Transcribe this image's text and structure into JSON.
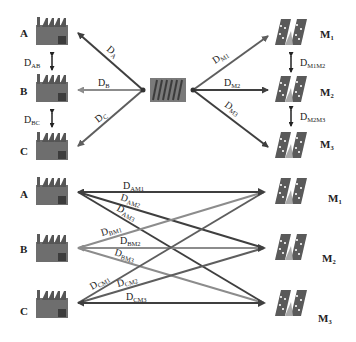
{
  "colors": {
    "dark_line": "#3f3f3f",
    "mid_line": "#5e5e5e",
    "light_line": "#8c8c8c",
    "factory_body": "#6e6e6e",
    "factory_door": "#3c3c3c",
    "market_fill": "#5a5a5a"
  },
  "top": {
    "factories": [
      {
        "id": "A",
        "label": "A"
      },
      {
        "id": "B",
        "label": "B"
      },
      {
        "id": "C",
        "label": "C"
      }
    ],
    "factory_distances": [
      {
        "main": "D",
        "sub": "AB"
      },
      {
        "main": "D",
        "sub": "BC"
      }
    ],
    "hub_to_factories": [
      {
        "main": "D",
        "sub": "A"
      },
      {
        "main": "D",
        "sub": "B"
      },
      {
        "main": "D",
        "sub": "C"
      }
    ],
    "hub_to_markets": [
      {
        "main": "D",
        "sub": "M1"
      },
      {
        "main": "D",
        "sub": "M2"
      },
      {
        "main": "D",
        "sub": "M3"
      }
    ],
    "markets": [
      {
        "main": "M",
        "sub": "1"
      },
      {
        "main": "M",
        "sub": "2"
      },
      {
        "main": "M",
        "sub": "3"
      }
    ],
    "market_distances": [
      {
        "main": "D",
        "sub": "M1M2"
      },
      {
        "main": "D",
        "sub": "M2M3"
      }
    ]
  },
  "bottom": {
    "factories": [
      {
        "id": "A",
        "label": "A"
      },
      {
        "id": "B",
        "label": "B"
      },
      {
        "id": "C",
        "label": "C"
      }
    ],
    "markets": [
      {
        "main": "M",
        "sub": "1"
      },
      {
        "main": "M",
        "sub": "2"
      },
      {
        "main": "M",
        "sub": "3"
      }
    ],
    "links": [
      {
        "main": "D",
        "sub": "AM1"
      },
      {
        "main": "D",
        "sub": "AM2"
      },
      {
        "main": "D",
        "sub": "AM3"
      },
      {
        "main": "D",
        "sub": "BM1"
      },
      {
        "main": "D",
        "sub": "BM2"
      },
      {
        "main": "D",
        "sub": "BM3"
      },
      {
        "main": "D",
        "sub": "CM1"
      },
      {
        "main": "D",
        "sub": "CM2"
      },
      {
        "main": "D",
        "sub": "CM3"
      }
    ]
  }
}
